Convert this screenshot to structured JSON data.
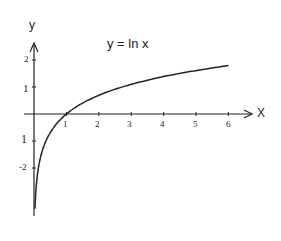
{
  "chart_data": {
    "type": "line",
    "title": "y = ln x",
    "xlabel": "X",
    "ylabel": "y",
    "x_ticks": [
      "1",
      "2",
      "3",
      "4",
      "5",
      "6"
    ],
    "y_ticks": [
      "2",
      "1",
      "1",
      "-2"
    ],
    "y_tick_values": [
      2,
      1,
      -1,
      -2
    ],
    "xlim": [
      0,
      6.7
    ],
    "ylim": [
      -3.7,
      2.8
    ],
    "grid": false,
    "legend": null,
    "series": [
      {
        "name": "y = ln x",
        "x": [
          0.03,
          0.05,
          0.1,
          0.2,
          0.3,
          0.5,
          0.75,
          1,
          1.5,
          2,
          2.5,
          3,
          3.5,
          4,
          4.5,
          5,
          5.5,
          6
        ],
        "y": [
          -3.51,
          -3.0,
          -2.3,
          -1.61,
          -1.2,
          -0.69,
          -0.29,
          0,
          0.41,
          0.69,
          0.92,
          1.1,
          1.25,
          1.39,
          1.5,
          1.61,
          1.7,
          1.79
        ]
      }
    ],
    "color": "#222222"
  }
}
